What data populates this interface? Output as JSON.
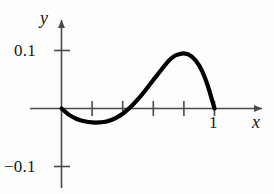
{
  "figure": {
    "name": "cubic-polynomial-plot",
    "background_color": "#fdfdfd",
    "curve_color": "#000000",
    "axis_color": "#4a4a4a"
  },
  "axes": {
    "x_axis_label": "x",
    "y_axis_label": "y",
    "x_tick_labels": [
      "1"
    ],
    "y_tick_labels": [
      "0.1",
      "−0.1"
    ],
    "y_tick_values": [
      0.1,
      -0.1
    ],
    "x_tick_values": [
      0.2,
      0.4,
      0.6,
      0.8,
      1.0
    ],
    "x_labeled_tick_value": 1
  },
  "chart_data": {
    "type": "line",
    "title": "",
    "subtitle": "",
    "xlabel": "x",
    "ylabel": "y",
    "xlim": [
      -0.06,
      1.3
    ],
    "ylim": [
      -0.16,
      0.16
    ],
    "grid": false,
    "legend": false,
    "legend_position": "none",
    "xticks": [
      0.2,
      0.4,
      0.6,
      0.8,
      1.0
    ],
    "xticklabels": [
      "",
      "",
      "",
      "",
      "1"
    ],
    "yticks": [
      -0.1,
      0.1
    ],
    "yticklabels": [
      "−0.1",
      "0.1"
    ],
    "annotations": [],
    "series": [
      {
        "name": "curve",
        "x": [
          0.0,
          0.05,
          0.1,
          0.15,
          0.2,
          0.25,
          0.28,
          0.3,
          0.35,
          0.4,
          0.45,
          0.5,
          0.55,
          0.6,
          0.65,
          0.7,
          0.72,
          0.75,
          0.8,
          0.85,
          0.9,
          0.95,
          1.0
        ],
        "y": [
          0.0,
          -0.011,
          -0.018,
          -0.022,
          -0.024,
          -0.024,
          -0.023,
          -0.022,
          -0.017,
          -0.009,
          0.002,
          0.016,
          0.032,
          0.049,
          0.066,
          0.082,
          0.087,
          0.092,
          0.095,
          0.09,
          0.074,
          0.044,
          0.0
        ],
        "roots": [
          0,
          1
        ],
        "maximum": {
          "x": 0.8,
          "y": 0.095
        },
        "minimum": {
          "x": 0.25,
          "y": -0.024
        }
      }
    ]
  }
}
